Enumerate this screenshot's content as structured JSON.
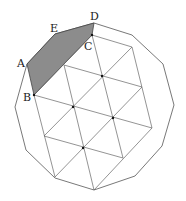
{
  "diagram": {
    "type": "geometry",
    "colors": {
      "shade": "#8c8c8c",
      "line": "#555555",
      "background": "#ffffff"
    },
    "labels": [
      {
        "id": "A",
        "text": "A",
        "x": 17,
        "y": 67
      },
      {
        "id": "B",
        "text": "B",
        "x": 23,
        "y": 101
      },
      {
        "id": "C",
        "text": "C",
        "x": 84,
        "y": 50
      },
      {
        "id": "D",
        "text": "D",
        "x": 90,
        "y": 20
      },
      {
        "id": "E",
        "text": "E",
        "x": 50,
        "y": 32
      }
    ],
    "dodecagon": [
      [
        94,
        23
      ],
      [
        132,
        35
      ],
      [
        163,
        64
      ],
      [
        174,
        105
      ],
      [
        162,
        146
      ],
      [
        135,
        176
      ],
      [
        94,
        190
      ],
      [
        55,
        178
      ],
      [
        26,
        150
      ],
      [
        15,
        107
      ],
      [
        27,
        64
      ],
      [
        55,
        34
      ]
    ],
    "shaded_pentagon": [
      [
        27,
        64
      ],
      [
        55,
        34
      ],
      [
        94,
        23
      ],
      [
        92,
        35
      ],
      [
        34,
        95
      ]
    ],
    "grid_lines": [
      [
        [
          34,
          95
        ],
        [
          92,
          35
        ]
      ],
      [
        [
          44,
          136
        ],
        [
          132,
          47
        ]
      ],
      [
        [
          55,
          177
        ],
        [
          142,
          87
        ]
      ],
      [
        [
          94,
          190
        ],
        [
          152,
          128
        ]
      ],
      [
        [
          64,
          65
        ],
        [
          94,
          190
        ]
      ],
      [
        [
          92,
          35
        ],
        [
          123,
          158
        ]
      ],
      [
        [
          132,
          47
        ],
        [
          152,
          128
        ]
      ],
      [
        [
          34,
          95
        ],
        [
          55,
          177
        ]
      ],
      [
        [
          34,
          95
        ],
        [
          152,
          128
        ]
      ],
      [
        [
          44,
          136
        ],
        [
          123,
          158
        ]
      ],
      [
        [
          64,
          65
        ],
        [
          142,
          87
        ]
      ],
      [
        [
          92,
          35
        ],
        [
          132,
          47
        ]
      ]
    ],
    "grid_dots": [
      [
        102,
        76
      ],
      [
        73,
        107
      ],
      [
        113,
        118
      ],
      [
        83,
        148
      ],
      [
        34,
        95
      ],
      [
        92,
        35
      ]
    ]
  }
}
